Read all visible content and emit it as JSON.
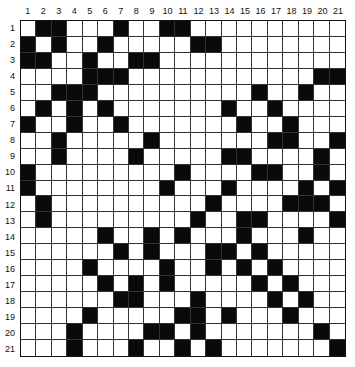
{
  "puzzle": {
    "rows": 21,
    "cols": 21,
    "column_labels": [
      "1",
      "2",
      "3",
      "4",
      "5",
      "6",
      "7",
      "8",
      "9",
      "10",
      "11",
      "12",
      "13",
      "14",
      "15",
      "16",
      "17",
      "18",
      "19",
      "20",
      "21"
    ],
    "row_labels": [
      "1",
      "2",
      "3",
      "4",
      "5",
      "6",
      "7",
      "8",
      "9",
      "10",
      "11",
      "12",
      "13",
      "14",
      "15",
      "16",
      "17",
      "18",
      "19",
      "20",
      "21"
    ],
    "colors": {
      "filled": "#0a0a0a",
      "empty": "#ffffff",
      "line": "#333333"
    },
    "black_cells_by_row": [
      [
        2,
        3,
        7,
        10,
        11
      ],
      [
        1,
        3,
        6,
        12,
        13
      ],
      [
        1,
        2,
        5,
        8,
        9
      ],
      [
        5,
        6,
        7,
        20,
        21
      ],
      [
        3,
        4,
        5,
        16,
        19
      ],
      [
        2,
        4,
        6,
        14,
        17
      ],
      [
        1,
        4,
        7,
        15,
        18
      ],
      [
        3,
        9,
        17,
        18,
        21
      ],
      [
        3,
        8,
        14,
        15,
        20
      ],
      [
        1,
        11,
        16,
        17,
        20
      ],
      [
        1,
        10,
        14,
        19,
        21
      ],
      [
        2,
        13,
        18,
        19,
        20
      ],
      [
        2,
        12,
        15,
        16,
        21
      ],
      [
        6,
        9,
        11,
        15,
        19
      ],
      [
        7,
        9,
        13,
        14,
        16
      ],
      [
        5,
        10,
        13,
        15,
        17
      ],
      [
        6,
        8,
        10,
        16,
        18
      ],
      [
        7,
        8,
        12,
        17,
        19
      ],
      [
        5,
        11,
        12,
        14,
        18
      ],
      [
        4,
        9,
        10,
        12,
        20
      ],
      [
        4,
        8,
        11,
        13,
        21
      ]
    ]
  }
}
